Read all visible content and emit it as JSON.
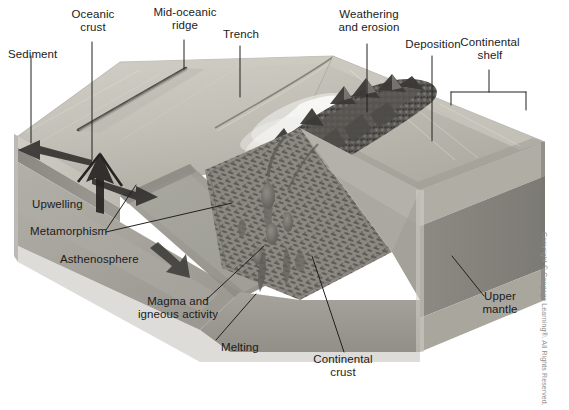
{
  "figure": {
    "background_color": "#ffffff",
    "label_color": "#1b1b1b",
    "leader_color": "#23201e"
  },
  "labels": {
    "sediment": "Sediment",
    "oceanic_crust": "Oceanic\ncrust",
    "mid_oceanic_ridge": "Mid-oceanic\nridge",
    "trench": "Trench",
    "weathering_and_erosion": "Weathering\nand erosion",
    "deposition": "Deposition",
    "continental_shelf": "Continental\nshelf",
    "upwelling": "Upwelling",
    "metamorphism": "Metamorphism",
    "asthenosphere": "Asthenosphere",
    "magma_and_igneous_activity": "Magma and\nigneous activity",
    "melting": "Melting",
    "continental_crust": "Continental\ncrust",
    "upper_mantle": "Upper\nmantle"
  },
  "credit": {
    "text": "Copyright © Cengage Learning®. All Rights Reserved."
  },
  "palette": {
    "ocean_floor_light": "#c9c6bd",
    "ocean_floor_mid": "#b4b1a8",
    "shelf_surface": "#bdbab1",
    "sediment_band": "#c4c1b8",
    "oceanic_crust_band": "#8f8d86",
    "asthenosphere": "#a6a49c",
    "upper_mantle_front": "#9b9992",
    "upper_mantle_side": "#87857e",
    "lithosphere_slab": "#9d9b93",
    "metamorphic_zone": "#7e7c75",
    "mountain_dark": "#4a4845",
    "mountain_mid": "#6f6d68",
    "plume_white": "#f0efec",
    "magma_blob": "#6a6863"
  },
  "features": {
    "arrows": [
      {
        "name": "seafloor-spreading-left",
        "direction": "left"
      },
      {
        "name": "seafloor-spreading-right",
        "direction": "right"
      },
      {
        "name": "upwelling-arrow",
        "direction": "up"
      },
      {
        "name": "subduction-arrow",
        "direction": "down-right"
      }
    ],
    "bracket": {
      "name": "continental-shelf-bracket"
    }
  }
}
